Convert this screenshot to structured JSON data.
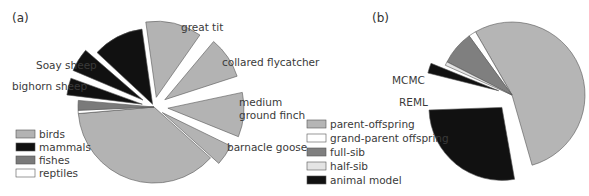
{
  "colors": {
    "birds": "#b3b3b3",
    "mammals": "#111111",
    "fishes": "#7a7a7a",
    "reptiles": "#ffffff",
    "parent_offspring": "#b5b5b5",
    "grand_parent_offspring": "#ffffff",
    "full_sib": "#7f7f7f",
    "half_sib": "#e4e4e4",
    "animal_model": "#111111",
    "outline": "#555555"
  },
  "panels": {
    "a": {
      "label": "(a)",
      "legend": [
        "birds",
        "mammals",
        "fishes",
        "reptiles"
      ],
      "annotations": [
        "great tit",
        "collared flycatcher",
        "medium",
        "ground finch",
        "barnacle goose",
        "Soay sheep",
        "bighorn sheep"
      ]
    },
    "b": {
      "label": "(b)",
      "legend": [
        "parent-offspring",
        "grand-parent offspring",
        "full-sib",
        "half-sib",
        "animal model"
      ],
      "annotations": [
        "MCMC",
        "REML"
      ]
    }
  },
  "chart_data": [
    {
      "type": "pie",
      "title": "(a)",
      "legend": [
        "birds",
        "mammals",
        "fishes",
        "reptiles"
      ],
      "legend_position": "bottom-left",
      "slices": [
        {
          "label": "great tit",
          "group": "birds",
          "start": -98,
          "end": -55,
          "explode": 10
        },
        {
          "label": "collared flycatcher",
          "group": "birds",
          "start": -50,
          "end": -18,
          "explode": 13
        },
        {
          "label": "medium ground finch",
          "group": "birds",
          "start": -12,
          "end": 22,
          "explode": 14
        },
        {
          "label": "barnacle goose",
          "group": "birds",
          "start": 26,
          "end": 42,
          "explode": 10
        },
        {
          "label": "other birds",
          "group": "birds",
          "start": 42,
          "end": 175,
          "explode": 0
        },
        {
          "label": "reptiles",
          "group": "reptiles",
          "start": 175,
          "end": 177.5,
          "explode": 0
        },
        {
          "label": "fishes",
          "group": "fishes",
          "start": 177.5,
          "end": 185,
          "explode": 0
        },
        {
          "label": "bighorn sheep",
          "group": "mammals",
          "start": 187,
          "end": 200,
          "explode": 12
        },
        {
          "label": "Soay sheep",
          "group": "mammals",
          "start": 203,
          "end": 221,
          "explode": 13
        },
        {
          "label": "other mammals",
          "group": "mammals",
          "start": 223,
          "end": 262,
          "explode": 3
        }
      ],
      "approx_share_pct": {
        "birds": 66,
        "mammals": 29,
        "fishes": 3,
        "reptiles": 1
      }
    },
    {
      "type": "pie",
      "title": "(b)",
      "legend": [
        "parent-offspring",
        "grand-parent offspring",
        "full-sib",
        "half-sib",
        "animal model"
      ],
      "legend_position": "bottom-left",
      "slices": [
        {
          "label": "parent-offspring",
          "group": "parent-offspring",
          "start": -120,
          "end": 74,
          "explode": 0
        },
        {
          "label": "grand-parent offspring",
          "group": "grand-parent offspring",
          "start": -126,
          "end": -120,
          "explode": 0
        },
        {
          "label": "full-sib",
          "group": "full-sib",
          "start": -153,
          "end": -126,
          "explode": 0
        },
        {
          "label": "half-sib",
          "group": "half-sib",
          "start": -156,
          "end": -153,
          "explode": 0
        },
        {
          "label": "MCMC",
          "group": "animal model",
          "start": -166,
          "end": -158,
          "explode": 14
        },
        {
          "label": "REML",
          "group": "animal model",
          "start": 80,
          "end": 178,
          "explode": 16
        }
      ],
      "approx_share_pct": {
        "parent-offspring": 54,
        "grand-parent offspring": 2,
        "full-sib": 7,
        "half-sib": 1,
        "animal model": 31
      }
    }
  ]
}
